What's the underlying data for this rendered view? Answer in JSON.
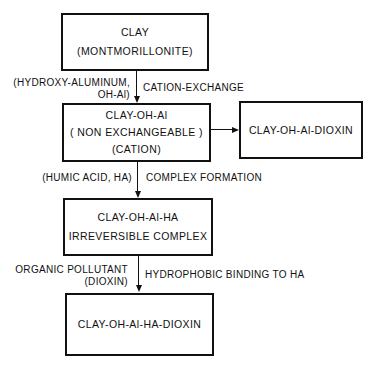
{
  "diagram": {
    "nodes": {
      "clay": {
        "lines": [
          "CLAY",
          "(MONTMORILLONITE)"
        ]
      },
      "clay_oh_al": {
        "lines": [
          "CLAY-OH-Al",
          "( NON EXCHANGEABLE )",
          "(CATION)"
        ]
      },
      "clay_oh_al_dioxin": {
        "lines": [
          "CLAY-OH-Al-DIOXIN"
        ]
      },
      "clay_oh_al_ha": {
        "lines": [
          "CLAY-OH-Al-HA",
          "IRREVERSIBLE COMPLEX"
        ]
      },
      "clay_oh_al_ha_dioxin": {
        "lines": [
          "CLAY-OH-Al-HA-DIOXIN"
        ]
      }
    },
    "edges": [
      {
        "from": "clay",
        "to": "clay_oh_al",
        "left_label": [
          "(HYDROXY-ALUMINUM,",
          "OH-Al)"
        ],
        "right_label": "CATION-EXCHANGE"
      },
      {
        "from": "clay_oh_al",
        "to": "clay_oh_al_dioxin"
      },
      {
        "from": "clay_oh_al",
        "to": "clay_oh_al_ha",
        "left_label": [
          "(HUMIC ACID, HA)"
        ],
        "right_label": "COMPLEX FORMATION"
      },
      {
        "from": "clay_oh_al_ha",
        "to": "clay_oh_al_ha_dioxin",
        "left_label": [
          "ORGANIC POLLUTANT",
          "(DIOXIN)"
        ],
        "right_label": "HYDROPHOBIC BINDING TO HA"
      }
    ]
  }
}
